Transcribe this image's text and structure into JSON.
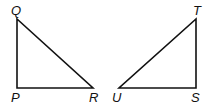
{
  "diagram": {
    "triangles": [
      {
        "name": "PQR",
        "vertices": [
          {
            "label": "Q",
            "x": 17,
            "y": 19
          },
          {
            "label": "P",
            "x": 17,
            "y": 88
          },
          {
            "label": "R",
            "x": 93,
            "y": 88
          }
        ],
        "right_angle_at": "P"
      },
      {
        "name": "STU",
        "vertices": [
          {
            "label": "T",
            "x": 196,
            "y": 19
          },
          {
            "label": "S",
            "x": 196,
            "y": 88
          },
          {
            "label": "U",
            "x": 119,
            "y": 88
          }
        ],
        "right_angle_at": "S"
      }
    ],
    "labels": {
      "q": "Q",
      "p": "P",
      "r": "R",
      "t": "T",
      "s": "S",
      "u": "U"
    },
    "stroke_color": "#111111"
  }
}
